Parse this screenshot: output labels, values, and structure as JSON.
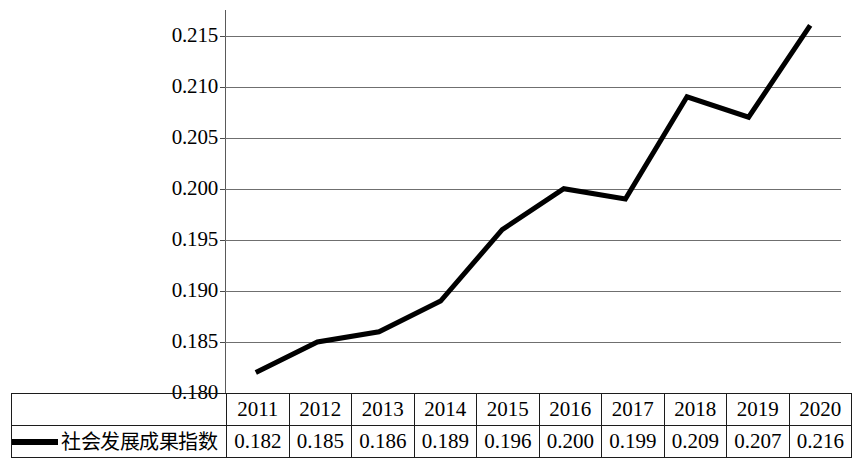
{
  "chart_data": {
    "type": "line",
    "title": "",
    "xlabel": "",
    "ylabel": "",
    "categories": [
      "2011",
      "2012",
      "2013",
      "2014",
      "2015",
      "2016",
      "2017",
      "2018",
      "2019",
      "2020"
    ],
    "series": [
      {
        "name": "社会发展成果指数",
        "values": [
          0.182,
          0.185,
          0.186,
          0.189,
          0.196,
          0.2,
          0.199,
          0.209,
          0.207,
          0.216
        ],
        "color": "#000000"
      }
    ],
    "value_labels": [
      "0.182",
      "0.185",
      "0.186",
      "0.189",
      "0.196",
      "0.200",
      "0.199",
      "0.209",
      "0.207",
      "0.216"
    ],
    "ylim": [
      0.18,
      0.2175
    ],
    "yticks": [
      0.18,
      0.185,
      0.19,
      0.195,
      0.2,
      0.205,
      0.21,
      0.215
    ],
    "ytick_labels": [
      "0.180",
      "0.185",
      "0.190",
      "0.195",
      "0.200",
      "0.205",
      "0.210",
      "0.215"
    ],
    "grid": true,
    "legend_position": "bottom-left-table",
    "gridline_color": "#6f6f6f"
  },
  "table": {
    "legend_label": "社会发展成果指数",
    "legend_marker": "line-swatch",
    "years": [
      "2011",
      "2012",
      "2013",
      "2014",
      "2015",
      "2016",
      "2017",
      "2018",
      "2019",
      "2020"
    ],
    "values": [
      "0.182",
      "0.185",
      "0.186",
      "0.189",
      "0.196",
      "0.200",
      "0.199",
      "0.209",
      "0.207",
      "0.216"
    ]
  }
}
